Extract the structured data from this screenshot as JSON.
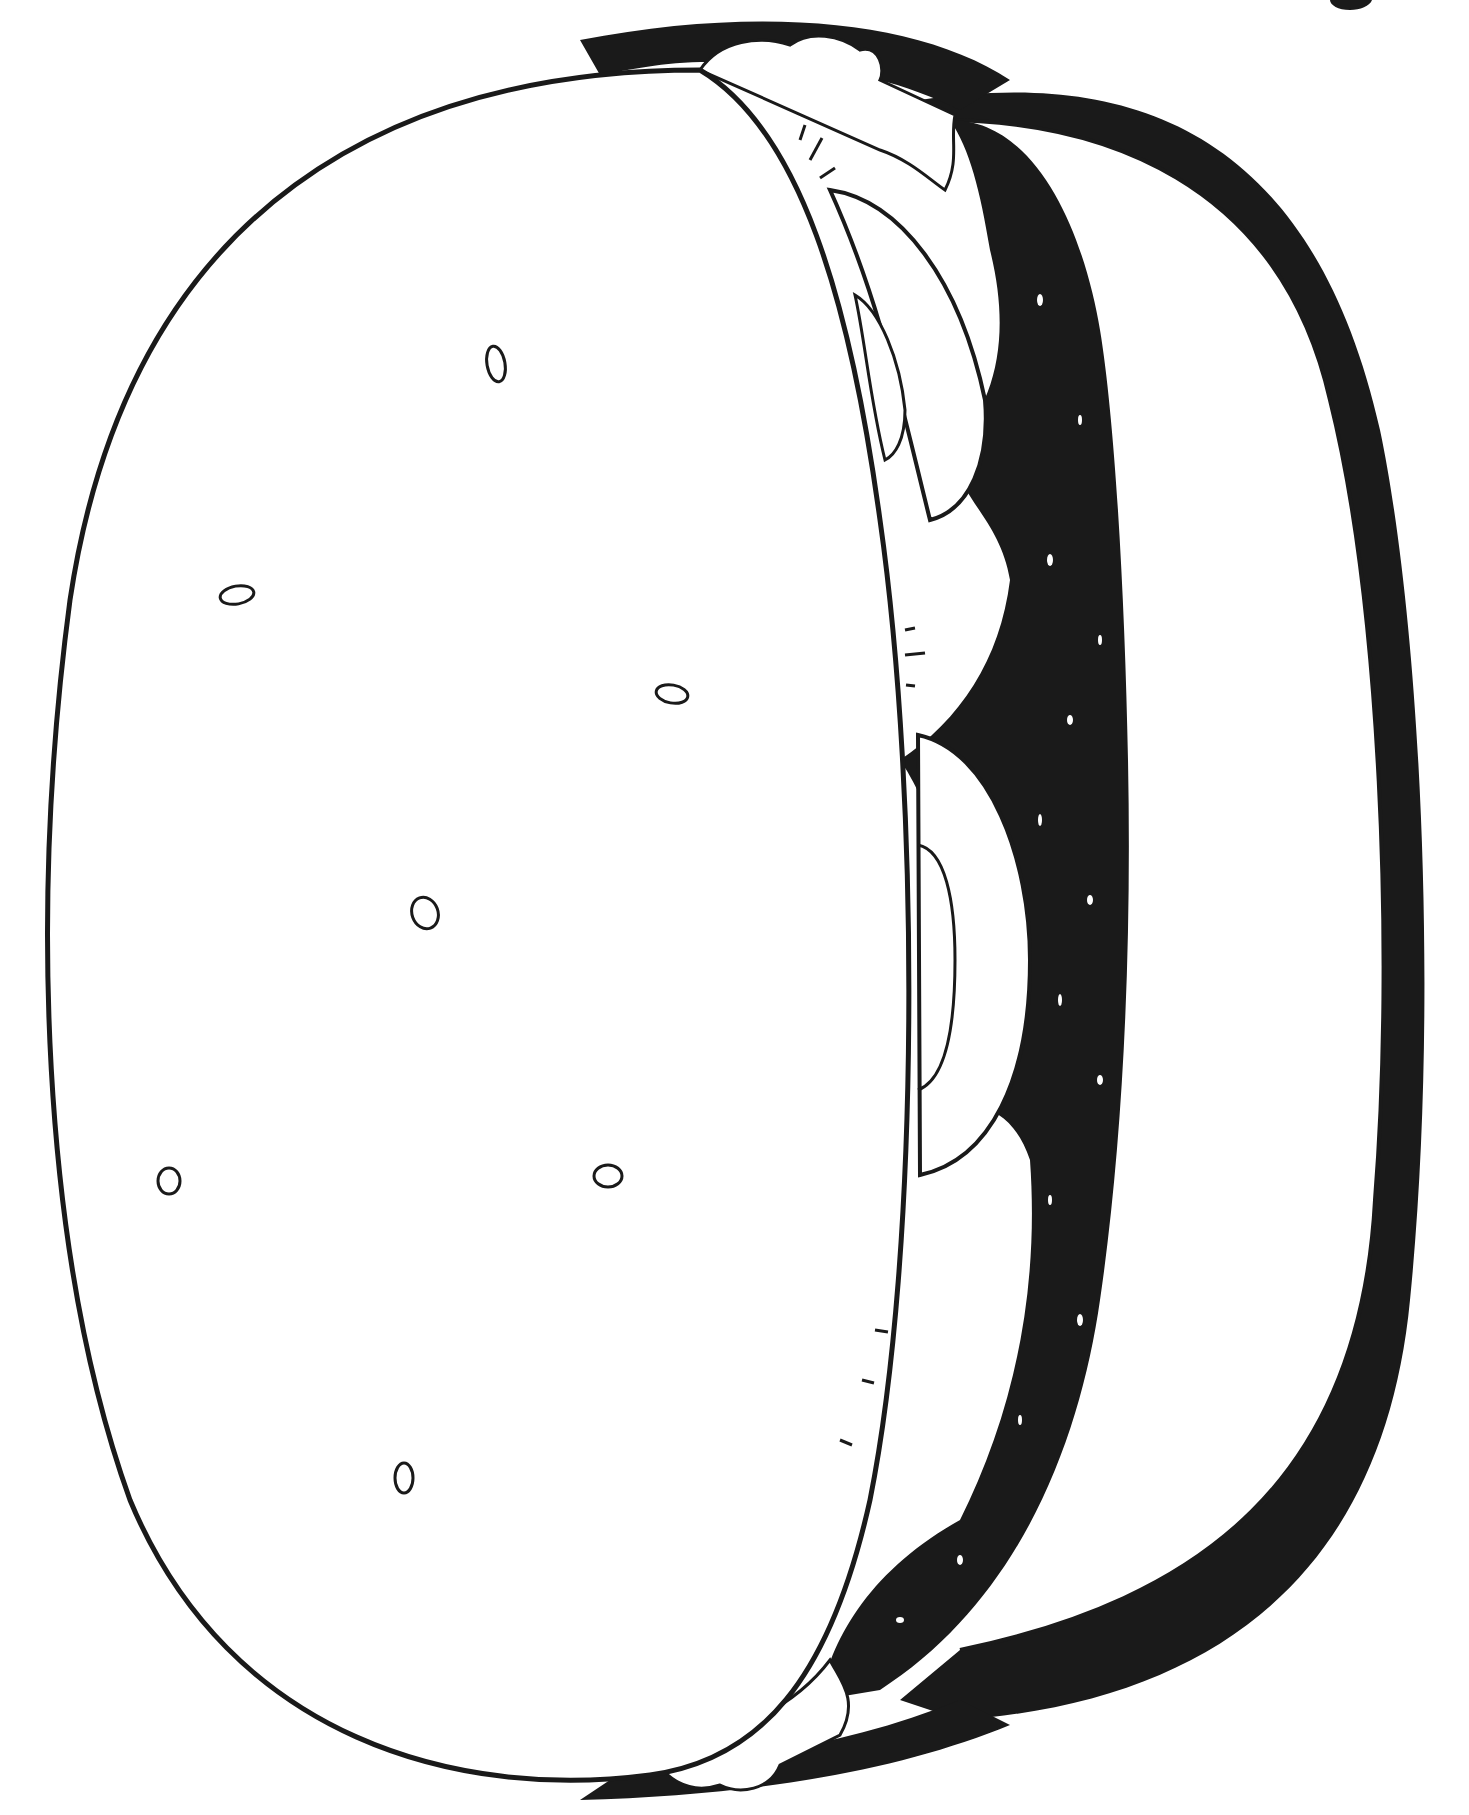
{
  "illustration": {
    "subject": "hamburger-coloring-page",
    "style": "black-and-white line art",
    "colors": {
      "ink": "#1a1a1a",
      "paper": "#ffffff",
      "speckle": "#ffffff"
    },
    "parts": [
      "top-bun",
      "bottom-bun",
      "lettuce",
      "tomato-slices",
      "patty"
    ],
    "sesame_seed_count": 8
  }
}
